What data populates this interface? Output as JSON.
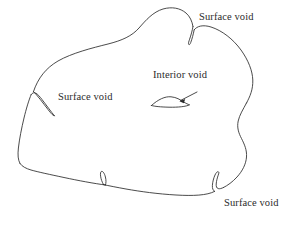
{
  "figure": {
    "background_color": "#ffffff",
    "line_color": "#2b2b2b",
    "text_color": "#2b2b2b",
    "width": 301,
    "height": 225
  },
  "labels": {
    "surface_void_top_right": "Surface void",
    "surface_void_left": "Surface void",
    "interior_void": "Interior void",
    "surface_void_bottom_right": "Surface void"
  },
  "features": {
    "body_outline": "irregular closed blob outline",
    "surface_void_top_right_notch": "narrow V-shaped notch in the top boundary",
    "surface_void_left_notch": "narrow wedge crack in the upper-left boundary",
    "surface_void_bottom_left_notch": "narrow crack in the lower boundary (unlabeled)",
    "surface_void_bottom_right_notch": "U-shaped notch in the bottom-right boundary",
    "interior_void_shape": "flat lens-shaped void inside the body",
    "interior_void_leader": "arrow from the Interior void label to the void"
  }
}
